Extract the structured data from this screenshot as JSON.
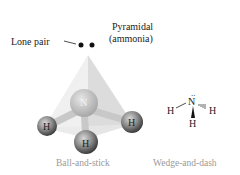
{
  "figure": {
    "title": {
      "line1": "Pyramidal",
      "line2": "(ammonia)"
    },
    "lone_pair_label": "Lone pair",
    "ball_and_stick": {
      "caption": "Ball-and-stick",
      "central_atom": "N",
      "atoms": [
        "H",
        "H",
        "H"
      ]
    },
    "wedge_and_dash": {
      "caption": "Wedge-and-dash",
      "central_atom": "N",
      "lone_pair_dots": "..",
      "atoms": {
        "left": "H",
        "right": "H",
        "bottom": "H"
      }
    },
    "colors": {
      "pyramid_light": "#eeeeee",
      "pyramid_mid": "#d9d9d9",
      "atom_dark": "#555555",
      "atom_light": "#bdbdbd",
      "caption": "#9a9a9a"
    }
  }
}
